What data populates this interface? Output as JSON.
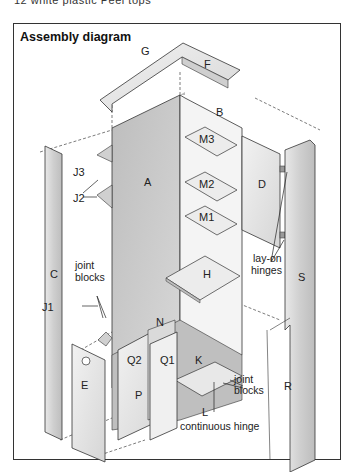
{
  "caption": "12 white plastic Peel tops",
  "diagram": {
    "title": "Assembly diagram",
    "parts": {
      "A": "A",
      "B": "B",
      "C": "C",
      "D": "D",
      "E": "E",
      "F": "F",
      "G": "G",
      "H": "H",
      "K": "K",
      "L": "L",
      "N": "N",
      "P": "P",
      "Q1": "Q1",
      "Q2": "Q2",
      "R": "R",
      "S": "S",
      "M1": "M1",
      "M2": "M2",
      "M3": "M3",
      "J1": "J1",
      "J2": "J2",
      "J3": "J3"
    },
    "annotations": {
      "joint_blocks_left_1": "joint",
      "joint_blocks_left_2": "blocks",
      "lay_on_hinges_1": "lay-on",
      "lay_on_hinges_2": "hinges",
      "joint_blocks_right_1": "joint",
      "joint_blocks_right_2": "blocks",
      "continuous_hinge": "continuous hinge"
    }
  }
}
